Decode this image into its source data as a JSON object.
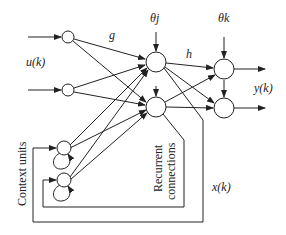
{
  "diagram": {
    "labels": {
      "input": "u(k)",
      "input_weights": "g",
      "hidden_bias": "θj",
      "output_bias": "θk",
      "hidden_weights": "h",
      "output": "y(k)",
      "state": "x(k)",
      "context_units": "Context units",
      "recurrent_line1": "Recurrent",
      "recurrent_line2": "connections"
    },
    "nodes": {
      "input": [
        {
          "id": "i1",
          "x": 68,
          "y": 37
        },
        {
          "id": "i2",
          "x": 68,
          "y": 90
        }
      ],
      "hidden": [
        {
          "id": "h1",
          "x": 156,
          "y": 62
        },
        {
          "id": "h2",
          "x": 156,
          "y": 107
        }
      ],
      "output": [
        {
          "id": "o1",
          "x": 224,
          "y": 69
        },
        {
          "id": "o2",
          "x": 224,
          "y": 108
        }
      ],
      "context": [
        {
          "id": "c1",
          "x": 64,
          "y": 148
        },
        {
          "id": "c2",
          "x": 64,
          "y": 180
        }
      ]
    },
    "colors": {
      "stroke": "#222222",
      "background": "#ffffff"
    }
  }
}
